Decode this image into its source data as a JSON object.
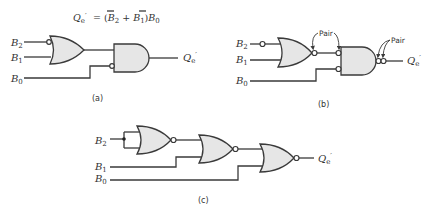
{
  "figure": {
    "panel_a": {
      "caption": "(a)",
      "equation": {
        "lhs": "Q",
        "lhs_sub": "e",
        "lhs_prime": "′",
        "rhs_parts": [
          "= (",
          "B",
          "2",
          " + ",
          "B",
          "1",
          ")",
          "B",
          "0"
        ]
      },
      "inputs": [
        {
          "name": "B",
          "sub": "2"
        },
        {
          "name": "B",
          "sub": "1"
        },
        {
          "name": "B",
          "sub": "0"
        }
      ],
      "output": {
        "name": "Q",
        "sub": "e",
        "prime": "′"
      },
      "gates": [
        "OR (inverted B2 input)",
        "AND (inverted B0 input)"
      ]
    },
    "panel_b": {
      "caption": "(b)",
      "inputs": [
        {
          "name": "B",
          "sub": "2"
        },
        {
          "name": "B",
          "sub": "1"
        },
        {
          "name": "B",
          "sub": "0"
        }
      ],
      "output": {
        "name": "Q",
        "sub": "e",
        "prime": "′"
      },
      "annotations": [
        "Pair",
        "Pair"
      ],
      "gates": [
        "OR with bubbles",
        "AND with bubbles"
      ]
    },
    "panel_c": {
      "caption": "(c)",
      "inputs": [
        {
          "name": "B",
          "sub": "2"
        },
        {
          "name": "B",
          "sub": "1"
        },
        {
          "name": "B",
          "sub": "0"
        }
      ],
      "output": {
        "name": "Q",
        "sub": "e",
        "prime": "′"
      },
      "gates": [
        "NOR",
        "NOR",
        "NOR"
      ]
    }
  }
}
